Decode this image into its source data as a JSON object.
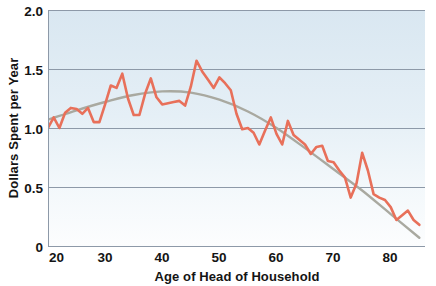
{
  "chart_data": {
    "type": "line",
    "title": "",
    "xlabel": "Age of Head of Household",
    "ylabel": "Dollars Spent per Year",
    "xlim": [
      20,
      86
    ],
    "ylim": [
      0,
      2.0
    ],
    "xticks": [
      20,
      30,
      40,
      50,
      60,
      70,
      80
    ],
    "xtick_labels": [
      "20",
      "30",
      "40",
      "50",
      "60",
      "70",
      "80"
    ],
    "yticks": [
      0,
      0.5,
      1.0,
      1.5,
      2.0
    ],
    "ytick_labels": [
      "0",
      "0.5",
      "1.0",
      "1.5",
      "2.0"
    ],
    "grid": "horizontal",
    "legend": "none",
    "background": "gradient light-blue to white",
    "series": [
      {
        "name": "Dollars spent per year (observed)",
        "color": "#e8705a",
        "x": [
          20,
          21,
          22,
          23,
          24,
          25,
          26,
          27,
          28,
          29,
          30,
          31,
          32,
          33,
          34,
          35,
          36,
          37,
          38,
          39,
          40,
          41,
          42,
          43,
          44,
          45,
          46,
          47,
          48,
          49,
          50,
          51,
          52,
          53,
          54,
          55,
          56,
          57,
          58,
          59,
          60,
          61,
          62,
          63,
          64,
          65,
          66,
          67,
          68,
          69,
          70,
          71,
          72,
          73,
          74,
          75,
          76,
          77,
          78,
          79,
          80,
          81,
          82,
          83,
          84,
          85
        ],
        "values": [
          1.0,
          1.09,
          1.0,
          1.13,
          1.17,
          1.16,
          1.12,
          1.17,
          1.05,
          1.05,
          1.2,
          1.36,
          1.34,
          1.46,
          1.25,
          1.11,
          1.11,
          1.29,
          1.42,
          1.26,
          1.2,
          1.21,
          1.22,
          1.23,
          1.19,
          1.35,
          1.57,
          1.48,
          1.41,
          1.34,
          1.43,
          1.38,
          1.32,
          1.12,
          0.99,
          1.0,
          0.96,
          0.86,
          0.98,
          1.09,
          0.95,
          0.86,
          1.06,
          0.94,
          0.9,
          0.86,
          0.78,
          0.84,
          0.85,
          0.72,
          0.71,
          0.64,
          0.58,
          0.41,
          0.53,
          0.79,
          0.64,
          0.44,
          0.41,
          0.39,
          0.33,
          0.22,
          0.26,
          0.3,
          0.22,
          0.18
        ]
      },
      {
        "name": "Smoothed trend",
        "color": "#a9a9a0",
        "x": [
          20,
          25,
          30,
          35,
          40,
          45,
          50,
          55,
          60,
          65,
          70,
          75,
          80,
          85
        ],
        "values": [
          1.07,
          1.15,
          1.22,
          1.28,
          1.31,
          1.3,
          1.24,
          1.14,
          1.0,
          0.83,
          0.65,
          0.47,
          0.27,
          0.07
        ]
      }
    ]
  },
  "axes": {
    "x_title": "Age of Head of Household",
    "y_title": "Dollars Spent per Year"
  },
  "colors": {
    "data_line": "#e8705a",
    "trend_line": "#a9a9a0",
    "gridline": "#8d99a8",
    "axis": "#8d99a8",
    "text": "#141414",
    "plot_bg_top": "#dbe8f1",
    "plot_bg_bottom": "#fafcfd"
  }
}
